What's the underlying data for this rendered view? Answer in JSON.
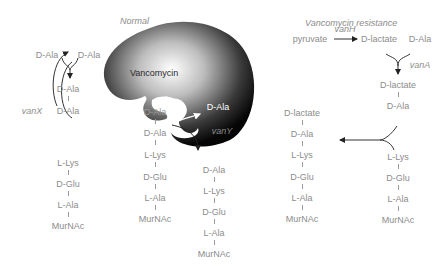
{
  "headings": {
    "normal": "Normal",
    "resistance": "Vancomycin resistance"
  },
  "vancomycin_label": "Vancomycin",
  "normal": {
    "top_pair": [
      "D-Ala",
      "D-Ala"
    ],
    "dipeptide": [
      "D-Ala",
      "D-Ala"
    ],
    "enzyme_x": "vanX",
    "enzyme_y": "vanY",
    "released": "D-Ala",
    "stem_left": [
      "L-Lys",
      "D-Glu",
      "L-Ala",
      "MurNAc"
    ],
    "stem_bound": [
      "D-Ala",
      "D-Ala",
      "L-Lys",
      "D-Glu",
      "L-Ala",
      "MurNAc"
    ],
    "stem_cleaved": [
      "D-Ala",
      "L-Lys",
      "D-Glu",
      "L-Ala",
      "MurNAc"
    ]
  },
  "resistance": {
    "pyruvate": "pyruvate",
    "enzyme_h": "vanH",
    "dlactate": "D-lactate",
    "dala": "D-Ala",
    "enzyme_a": "vanA",
    "depsipeptide": [
      "D-lactate",
      "D-Ala"
    ],
    "stem_right": [
      "L-Lys",
      "D-Glu",
      "L-Ala",
      "MurNAc"
    ],
    "stem_product": [
      "D-lactate",
      "D-Ala",
      "L-Lys",
      "D-Glu",
      "L-Ala",
      "MurNAc"
    ]
  }
}
